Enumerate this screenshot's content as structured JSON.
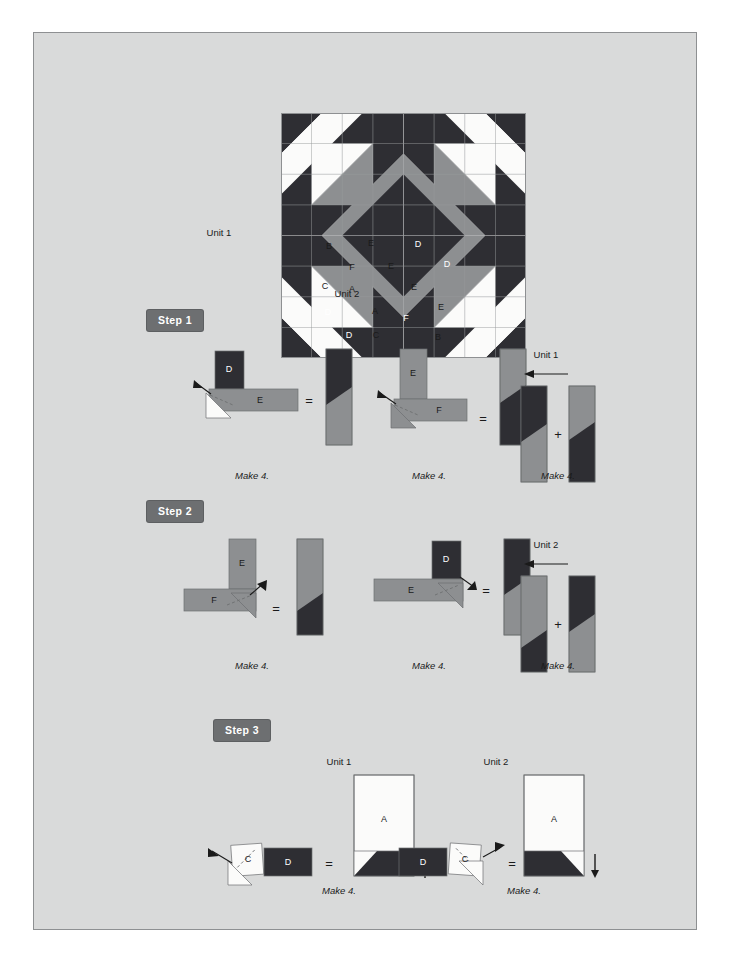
{
  "palette": {
    "page_background": "#ffffff",
    "sheet_background": "#d9dada",
    "sheet_border": "#8e9092",
    "fabric_dark": "#2e2e33",
    "fabric_medium": "#8d8f91",
    "fabric_light": "#fbfbfa",
    "seam_line": "#9a9c9e",
    "badge_fill": "#6d6f71",
    "badge_text": "#ffffff",
    "ink": "#1a1a1a"
  },
  "block_diagram": {
    "name": "eight-pointed-star-quilt-block",
    "side_label": "Unit 1",
    "bottom_label": "Unit 2",
    "piece_labels": [
      {
        "text": "B",
        "x": 48,
        "y": 133,
        "dark": false
      },
      {
        "text": "E",
        "x": 90,
        "y": 130,
        "dark": false
      },
      {
        "text": "D",
        "x": 137,
        "y": 131,
        "dark": true
      },
      {
        "text": "F",
        "x": 71,
        "y": 154,
        "dark": false
      },
      {
        "text": "E",
        "x": 110,
        "y": 153,
        "dark": false
      },
      {
        "text": "D",
        "x": 166,
        "y": 151,
        "dark": true
      },
      {
        "text": "C",
        "x": 44,
        "y": 173,
        "dark": false
      },
      {
        "text": "A",
        "x": 71,
        "y": 176,
        "dark": false
      },
      {
        "text": "E",
        "x": 133,
        "y": 174,
        "dark": false
      },
      {
        "text": "A",
        "x": 94,
        "y": 198,
        "dark": false
      },
      {
        "text": "E",
        "x": 160,
        "y": 194,
        "dark": false
      },
      {
        "text": "D",
        "x": 47,
        "y": 199,
        "dark": true
      },
      {
        "text": "F",
        "x": 125,
        "y": 205,
        "dark": true
      },
      {
        "text": "D",
        "x": 68,
        "y": 222,
        "dark": true
      },
      {
        "text": "C",
        "x": 95,
        "y": 222,
        "dark": false
      },
      {
        "text": "B",
        "x": 157,
        "y": 224,
        "dark": false
      }
    ]
  },
  "steps": [
    {
      "id": "step-1",
      "badge": "Step 1",
      "diagrams": [
        {
          "id": "s1-d1",
          "kind": "corner-fold-horizontal",
          "pieces": [
            {
              "label": "D",
              "dark": true
            },
            {
              "label": "E",
              "dark": false
            }
          ],
          "equals": "=",
          "caption": "Make 4."
        },
        {
          "id": "s1-d2",
          "kind": "corner-fold-vertical",
          "pieces": [
            {
              "label": "E",
              "dark": false
            },
            {
              "label": "F",
              "dark": false
            }
          ],
          "equals": "=",
          "caption": "Make 4."
        },
        {
          "id": "s1-d3",
          "kind": "join-pair",
          "unit_label": "Unit 1",
          "plus": "+",
          "caption": "Make 4."
        }
      ]
    },
    {
      "id": "step-2",
      "badge": "Step 2",
      "diagrams": [
        {
          "id": "s2-d1",
          "kind": "corner-fold-vertical",
          "pieces": [
            {
              "label": "E",
              "dark": false
            },
            {
              "label": "F",
              "dark": false
            }
          ],
          "equals": "=",
          "caption": "Make 4."
        },
        {
          "id": "s2-d2",
          "kind": "corner-fold-horizontal",
          "pieces": [
            {
              "label": "D",
              "dark": true
            },
            {
              "label": "E",
              "dark": false
            }
          ],
          "equals": "=",
          "caption": "Make 4."
        },
        {
          "id": "s2-d3",
          "kind": "join-pair",
          "unit_label": "Unit 2",
          "plus": "+",
          "caption": "Make 4."
        }
      ]
    },
    {
      "id": "step-3",
      "badge": "Step 3",
      "diagrams": [
        {
          "id": "s3-d1",
          "kind": "square-corner-unit",
          "unit_label": "Unit 1",
          "pieces": [
            {
              "label": "C",
              "dark": false
            },
            {
              "label": "D",
              "dark": true
            },
            {
              "label": "A",
              "dark": false
            }
          ],
          "equals": "=",
          "arrow_direction": "up",
          "caption": "Make 4."
        },
        {
          "id": "s3-d2",
          "kind": "square-corner-unit",
          "unit_label": "Unit 2",
          "pieces": [
            {
              "label": "D",
              "dark": true
            },
            {
              "label": "C",
              "dark": false
            },
            {
              "label": "A",
              "dark": false
            }
          ],
          "equals": "=",
          "arrow_direction": "down",
          "caption": "Make 4."
        }
      ]
    }
  ]
}
